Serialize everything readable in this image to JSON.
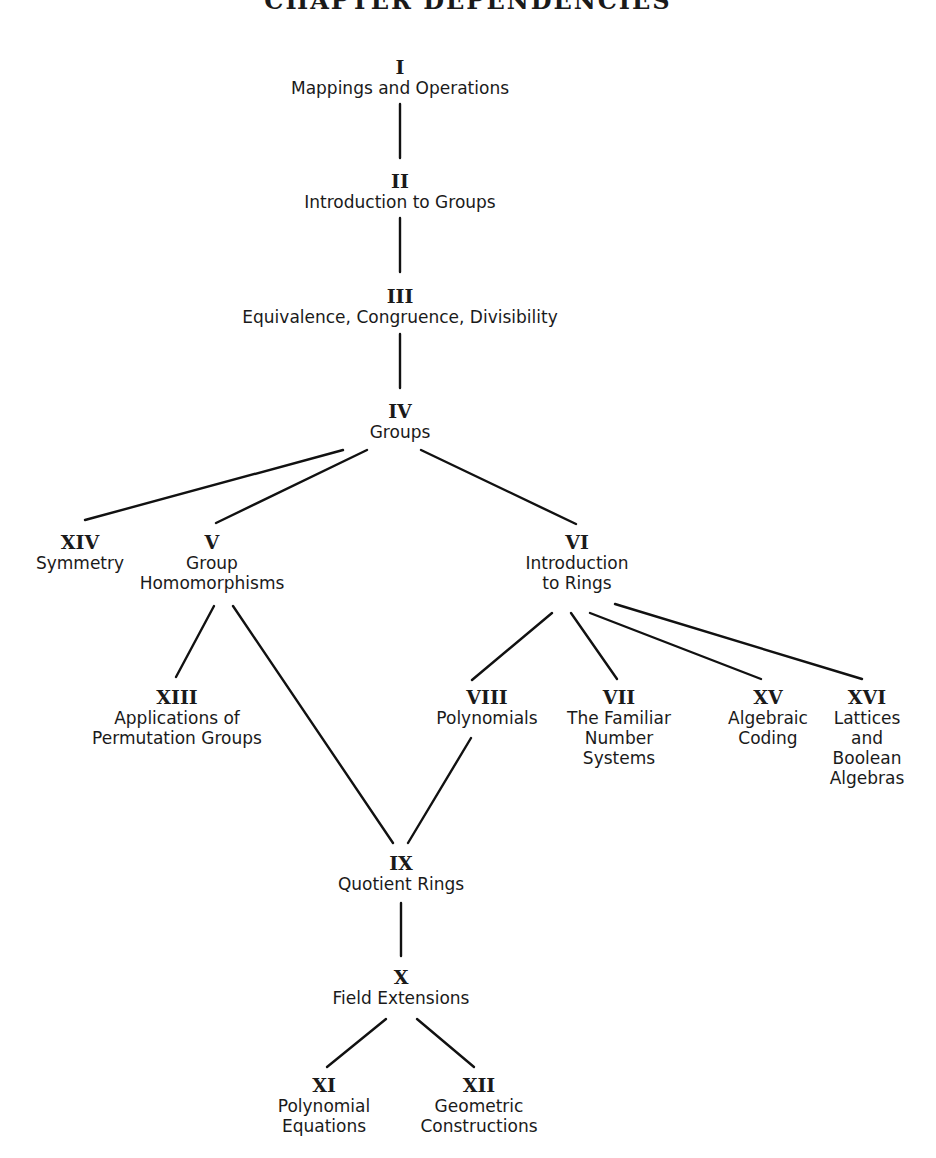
{
  "title": "CHAPTER DEPENDENCIES",
  "nodes": {
    "I": {
      "numeral": "I",
      "label": "Mappings and Operations"
    },
    "II": {
      "numeral": "II",
      "label": "Introduction to Groups"
    },
    "III": {
      "numeral": "III",
      "label": "Equivalence, Congruence, Divisibility"
    },
    "IV": {
      "numeral": "IV",
      "label": "Groups"
    },
    "XIV": {
      "numeral": "XIV",
      "label": "Symmetry"
    },
    "V": {
      "numeral": "V",
      "label": "Group\nHomomorphisms"
    },
    "VI": {
      "numeral": "VI",
      "label": "Introduction\nto Rings"
    },
    "XIII": {
      "numeral": "XIII",
      "label": "Applications of\nPermutation Groups"
    },
    "VIII": {
      "numeral": "VIII",
      "label": "Polynomials"
    },
    "VII": {
      "numeral": "VII",
      "label": "The Familiar\nNumber\nSystems"
    },
    "XV": {
      "numeral": "XV",
      "label": "Algebraic\nCoding"
    },
    "XVI": {
      "numeral": "XVI",
      "label": "Lattices\nand\nBoolean\nAlgebras"
    },
    "IX": {
      "numeral": "IX",
      "label": "Quotient Rings"
    },
    "X": {
      "numeral": "X",
      "label": "Field Extensions"
    },
    "XI": {
      "numeral": "XI",
      "label": "Polynomial\nEquations"
    },
    "XII": {
      "numeral": "XII",
      "label": "Geometric\nConstructions"
    }
  },
  "edges": [
    [
      "I",
      "II"
    ],
    [
      "II",
      "III"
    ],
    [
      "III",
      "IV"
    ],
    [
      "IV",
      "XIV"
    ],
    [
      "IV",
      "V"
    ],
    [
      "IV",
      "VI"
    ],
    [
      "V",
      "XIII"
    ],
    [
      "V",
      "IX"
    ],
    [
      "VI",
      "VIII"
    ],
    [
      "VI",
      "VII"
    ],
    [
      "VI",
      "XV"
    ],
    [
      "VI",
      "XVI"
    ],
    [
      "VIII",
      "IX"
    ],
    [
      "IX",
      "X"
    ],
    [
      "X",
      "XI"
    ],
    [
      "X",
      "XII"
    ]
  ]
}
